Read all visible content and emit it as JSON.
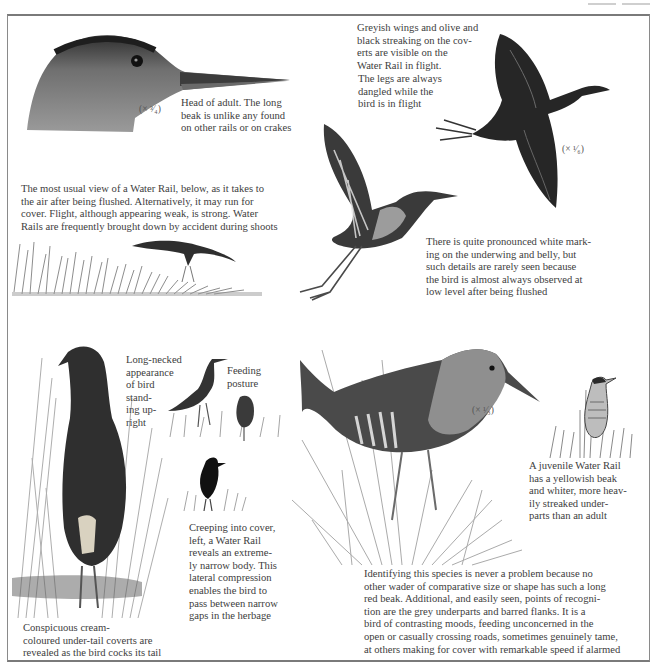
{
  "page": {
    "frame_color": "#8a8a8a",
    "ink_color": "#404040"
  },
  "illustrations": [
    {
      "id": "head-adult",
      "label": "Head of adult Water Rail",
      "scale": "(× ³⁄₄)"
    },
    {
      "id": "flight-top-right",
      "label": "Water Rail in flight, dorsal view",
      "scale": "(× ¹⁄₆)"
    },
    {
      "id": "takeoff",
      "label": "Water Rail taking off showing underwing"
    },
    {
      "id": "flushed-over-grass",
      "label": "Water Rail flushed over grass"
    },
    {
      "id": "standing-upright",
      "label": "Long-necked bird standing upright, rear view"
    },
    {
      "id": "feeding-posture",
      "label": "Feeding posture birds"
    },
    {
      "id": "creeping",
      "label": "Narrow-bodied bird creeping into cover"
    },
    {
      "id": "main-adult",
      "label": "Adult Water Rail in grass",
      "scale": "(× ¹⁄₃)"
    },
    {
      "id": "juvenile",
      "label": "Juvenile Water Rail"
    }
  ],
  "captions": {
    "head": "Head of adult. The long\nbeak is unlike any found\non other rails or on crakes",
    "flight_wings": "Greyish wings and olive and\nblack streaking on the cov-\nerts are visible on the\nWater Rail in flight.",
    "flight_legs": "The legs are always\ndangled while the\nbird is in flight",
    "usual_view": "The most usual view of a Water Rail, below, as it takes to\nthe air after being flushed. Alternatively, it may run for\ncover. Flight, although appearing weak, is strong. Water\nRails are frequently brought down by accident during shoots",
    "underwing": "There is quite pronounced white mark-\ning on the underwing and belly, but\nsuch details are rarely seen because\nthe bird is almost always observed at\nlow level after being flushed",
    "long_necked": "Long-necked\nappearance\nof bird\nstand-\ning up-\nright",
    "feeding": "Feeding\nposture",
    "creeping": "Creeping into cover,\nleft, a Water Rail\nreveals an extreme-\nly narrow body. This\nlateral compression\nenables the bird to\npass between narrow\ngaps in the herbage",
    "under_tail": "Conspicuous cream-\ncoloured under-tail coverts are\nrevealed as the bird cocks its tail",
    "juvenile": "A juvenile Water Rail\nhas a yellowish beak\nand whiter, more heav-\nily streaked under-\nparts than an adult",
    "identifying": "Identifying this species is never a problem because no\nother wader of comparative size or shape has such a long\nred beak. Additional, and easily seen, points of recogni-\ntion are the grey underparts and barred flanks. It is a\nbird of contrasting moods, feeding unconcerned in the\nopen or casually crossing roads, sometimes genuinely tame,\nat others making for cover with remarkable speed if alarmed"
  },
  "scales": {
    "head": "(× ³⁄₄)",
    "flight": "(× ¹⁄₆)",
    "main": "(× ¹⁄₃)"
  }
}
